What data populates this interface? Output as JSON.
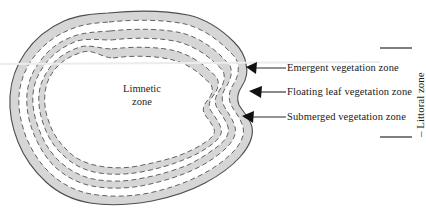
{
  "diagram": {
    "title_present": false,
    "center_label": {
      "line1": "Limnetic",
      "line2": "zone"
    },
    "bracket_label": "– Littoral zone",
    "callouts": [
      {
        "id": "emergent",
        "label": "Emergent vegetation zone",
        "arrow_tip_x": 246,
        "arrow_tip_y": 68,
        "leader_x": 286,
        "text_x": 287,
        "text_y": 64
      },
      {
        "id": "floating",
        "label": "Floating leaf vegetation zone",
        "arrow_tip_x": 250,
        "arrow_tip_y": 92,
        "leader_x": 286,
        "text_x": 287,
        "text_y": 88
      },
      {
        "id": "submerged",
        "label": "Submerged vegetation zone",
        "arrow_tip_x": 243,
        "arrow_tip_y": 117,
        "leader_x": 286,
        "text_x": 287,
        "text_y": 113
      }
    ],
    "bracket": {
      "top_tick_y": 48,
      "bottom_tick_y": 137,
      "tick_x1": 380,
      "tick_x2": 412,
      "text_x": 414,
      "text_y": 136
    },
    "colors": {
      "band_fill": "#d6d6d6",
      "outline": "#4d4d4d",
      "dashed": "#5a5a5a",
      "water": "#ffffff",
      "text": "#191919",
      "arrow": "#111111",
      "leader": "#2a2a2a",
      "tick": "#3a3a3a",
      "background": "#ffffff"
    },
    "zones": [
      {
        "name": "Emergent vegetation zone",
        "position": "outermost band"
      },
      {
        "name": "Floating leaf vegetation zone",
        "position": "middle band"
      },
      {
        "name": "Submerged vegetation zone",
        "position": "innermost band"
      },
      {
        "name": "Limnetic zone",
        "position": "open water center"
      },
      {
        "name": "Littoral zone",
        "position": "all three vegetated bands combined"
      }
    ]
  }
}
